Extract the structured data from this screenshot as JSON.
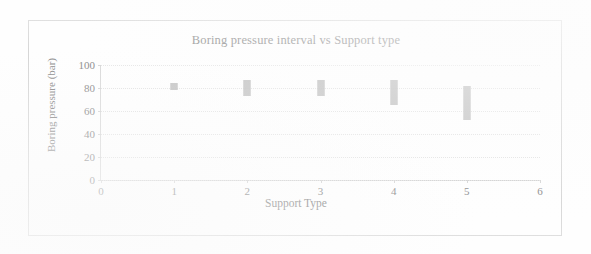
{
  "chart_data": {
    "type": "bar",
    "title": "Boring pressure interval vs Support type",
    "xlabel": "Support Type",
    "ylabel": "Boring pressure (bar)",
    "xlim": [
      0,
      6
    ],
    "ylim": [
      0,
      100
    ],
    "xticks": [
      "0",
      "1",
      "2",
      "3",
      "4",
      "5",
      "6"
    ],
    "yticks": [
      "0",
      "20",
      "40",
      "60",
      "80",
      "100"
    ],
    "grid": "horizontal",
    "legend": "none",
    "series": [
      {
        "name": "Boring pressure interval",
        "marker_color": "#bdbdbd",
        "points": [
          {
            "x": 1,
            "low": 78,
            "high": 84,
            "label": "Support type 1"
          },
          {
            "x": 2,
            "low": 73,
            "high": 87,
            "label": "Support type 2"
          },
          {
            "x": 3,
            "low": 73,
            "high": 87,
            "label": "Support type 3"
          },
          {
            "x": 4,
            "low": 65,
            "high": 87,
            "label": "Support type 4"
          },
          {
            "x": 5,
            "low": 52,
            "high": 82,
            "label": "Support type 5"
          }
        ]
      }
    ]
  },
  "colors": {
    "marker": "#bdbdbd",
    "gridline": "#e2e2e2",
    "axis": "#d5d5d5",
    "text": "#8a8a8a",
    "frame": "#d6d6d6"
  }
}
